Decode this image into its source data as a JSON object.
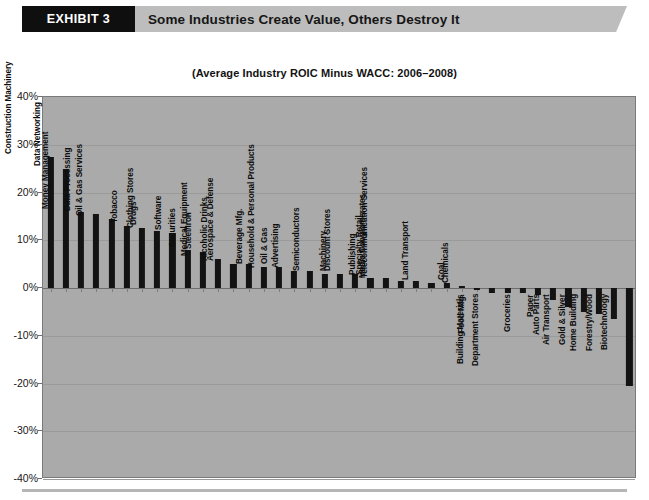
{
  "banner": {
    "exhibit_label": "EXHIBIT 3",
    "title": "Some Industries Create Value, Others Destroy It"
  },
  "chart_data": {
    "type": "bar",
    "title": "(Average Industry ROIC Minus WACC: 2006–2008)",
    "subtitle": "",
    "xlabel": "",
    "ylabel": "",
    "ylim": [
      -40,
      40
    ],
    "grid": true,
    "legend_position": "none",
    "ytick_labels": [
      "40%",
      "30%",
      "20%",
      "10%",
      "0%",
      "-10%",
      "-20%",
      "-30%",
      "-40%"
    ],
    "ytick_values": [
      40,
      30,
      20,
      10,
      0,
      -10,
      -20,
      -30,
      -40
    ],
    "categories": [
      "Construction Machinery",
      "Data Networking",
      "Money Management",
      "Data Processing",
      "Oil & Gas Services",
      "Tobacco",
      "Drugs",
      "Clothing Stores",
      "Software",
      "Securities",
      "Steel/Iron",
      "Medical Equipment",
      "Alcoholic Drinks",
      "Aerospace & Defense",
      "Beverage Mfg.",
      "Oil & Gas",
      "Advertising",
      "Household & Personal Products",
      "Semiconductors",
      "Machinery",
      "Discount Stores",
      "Publishing",
      "Specialty Retail",
      "Media Conglomerates",
      "Telecommunication Services",
      "Land Transport",
      "Coal",
      "Chemicals",
      "Food Mfg.",
      "Building Materials",
      "Department Stores",
      "Groceries",
      "Paper",
      "Auto Parts",
      "Air Transport",
      "Gold & Silver",
      "Home Building",
      "Forestry/Wood",
      "Biotechnology"
    ],
    "values": [
      27.5,
      25.0,
      16.0,
      15.5,
      14.5,
      13.0,
      12.5,
      12.0,
      11.5,
      8.0,
      7.5,
      6.0,
      5.0,
      5.0,
      4.5,
      4.5,
      3.5,
      3.5,
      3.0,
      3.0,
      3.0,
      2.0,
      2.0,
      1.5,
      1.5,
      1.0,
      1.0,
      0.5,
      -0.5,
      -1.0,
      -1.0,
      -1.0,
      -1.5,
      -2.5,
      -4.0,
      -5.0,
      -5.5,
      -6.5,
      -20.5
    ]
  }
}
